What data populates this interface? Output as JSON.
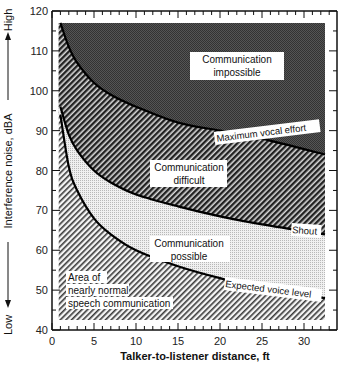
{
  "chart_data": {
    "type": "area",
    "title": "",
    "xlabel": "Talker-to-listener distance, ft",
    "ylabel": "Interference noise, dBA",
    "ylabel_high": "High",
    "ylabel_low": "Low",
    "xlim": [
      0,
      34
    ],
    "ylim": [
      40,
      120
    ],
    "x_ticks": [
      0,
      5,
      10,
      15,
      20,
      25,
      30
    ],
    "y_ticks": [
      40,
      50,
      60,
      70,
      80,
      90,
      100,
      110,
      120
    ],
    "grid": false,
    "x": [
      1,
      2,
      3,
      5,
      7,
      10,
      15,
      20,
      25,
      32.5
    ],
    "series": [
      {
        "name": "Maximum vocal effort",
        "values": [
          117,
          111,
          107,
          102,
          99,
          96,
          92,
          90,
          88,
          84
        ]
      },
      {
        "name": "Shout",
        "values": [
          96,
          89,
          85,
          80,
          77,
          74,
          71,
          68.5,
          66.5,
          64
        ]
      },
      {
        "name": "Expected voice level",
        "values": [
          94,
          81,
          75,
          68,
          64,
          60,
          56,
          53,
          50.5,
          48
        ]
      }
    ],
    "regions": [
      {
        "name": "Communication impossible",
        "label_lines": [
          "Communication",
          "impossible"
        ]
      },
      {
        "name": "Communication difficult",
        "label_lines": [
          "Communication",
          "difficult"
        ]
      },
      {
        "name": "Communication possible",
        "label_lines": [
          "Communication",
          "possible"
        ]
      },
      {
        "name": "Area of nearly normal speech communication",
        "label_lines": [
          "Area of",
          "nearly normal",
          "speech communication"
        ]
      }
    ],
    "shaded_extent": {
      "x": [
        0.8,
        32.5
      ],
      "y": [
        42.5,
        117
      ]
    }
  },
  "labels": {
    "xlabel": "Talker-to-listener distance, ft",
    "ylabel": "Interference noise, dBA",
    "high": "High",
    "low": "Low",
    "max_vocal": "Maximum vocal effort",
    "shout": "Shout",
    "expected": "Expected voice level",
    "impossible_1": "Communication",
    "impossible_2": "impossible",
    "difficult_1": "Communication",
    "difficult_2": "difficult",
    "possible_1": "Communication",
    "possible_2": "possible",
    "normal_1": "Area of",
    "normal_2": "nearly normal",
    "normal_3": "speech communication"
  }
}
